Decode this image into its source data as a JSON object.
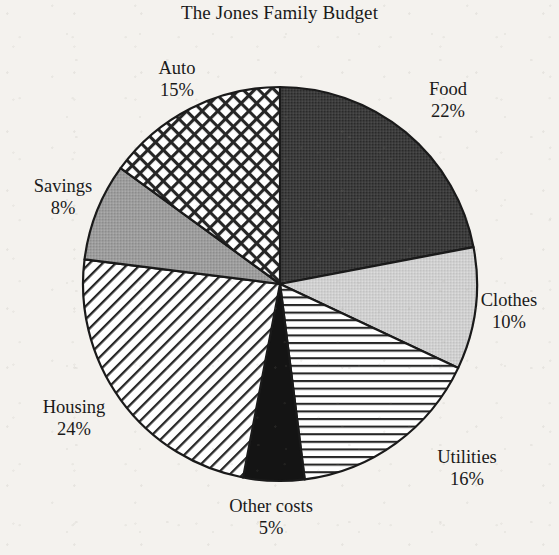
{
  "chart": {
    "title": "The Jones Family Budget"
  },
  "chart_data": {
    "type": "pie",
    "title": "The Jones Family Budget",
    "xlabel": "",
    "ylabel": "",
    "legend_position": "none",
    "grid": false,
    "units": "percent",
    "total": 100,
    "start_angle_deg": 0,
    "direction": "clockwise",
    "categories": [
      "Food",
      "Clothes",
      "Utilities",
      "Other costs",
      "Housing",
      "Savings",
      "Auto"
    ],
    "values": [
      22,
      10,
      16,
      5,
      24,
      8,
      15
    ],
    "slices": [
      {
        "label": "Food",
        "percent": 22,
        "percent_text": "22%",
        "fill_style": "solid-dark",
        "color": "#3a3a3a",
        "start_deg": 0,
        "end_deg": 79.2
      },
      {
        "label": "Clothes",
        "percent": 10,
        "percent_text": "10%",
        "fill_style": "solid-light-gray",
        "color": "#cdcdcd",
        "start_deg": 79.2,
        "end_deg": 115.2
      },
      {
        "label": "Utilities",
        "percent": 16,
        "percent_text": "16%",
        "fill_style": "horizontal-lines",
        "color": "#ffffff",
        "start_deg": 115.2,
        "end_deg": 172.8
      },
      {
        "label": "Other costs",
        "percent": 5,
        "percent_text": "5%",
        "fill_style": "solid-black",
        "color": "#111111",
        "start_deg": 172.8,
        "end_deg": 190.8
      },
      {
        "label": "Housing",
        "percent": 24,
        "percent_text": "24%",
        "fill_style": "diagonal-lines",
        "color": "#ffffff",
        "start_deg": 190.8,
        "end_deg": 277.2
      },
      {
        "label": "Savings",
        "percent": 8,
        "percent_text": "8%",
        "fill_style": "solid-mid-gray",
        "color": "#9a9a9a",
        "start_deg": 277.2,
        "end_deg": 306
      },
      {
        "label": "Auto",
        "percent": 15,
        "percent_text": "15%",
        "fill_style": "cross-hatch",
        "color": "#ffffff",
        "start_deg": 306,
        "end_deg": 360
      }
    ]
  },
  "geometry": {
    "center_x": 280,
    "center_y": 284,
    "radius": 197
  }
}
